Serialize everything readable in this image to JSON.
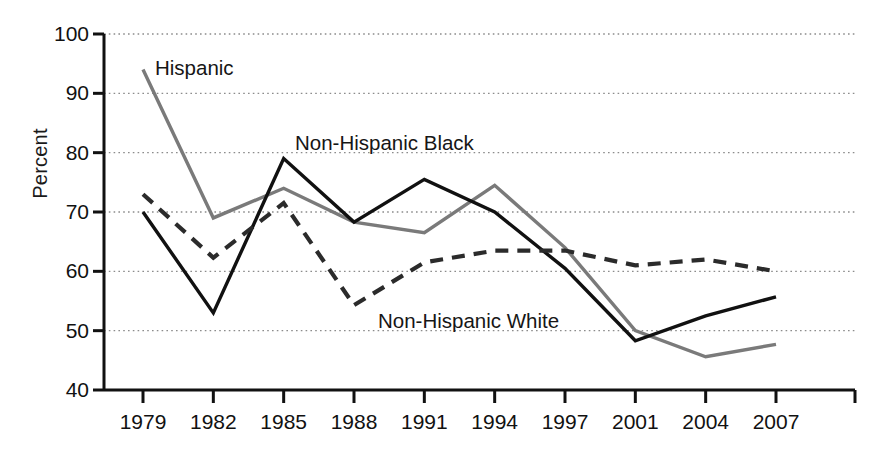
{
  "chart_data": {
    "type": "line",
    "title": "",
    "subtitle": "",
    "xlabel": "",
    "ylabel": "Percent",
    "categories": [
      "1979",
      "1982",
      "1985",
      "1988",
      "1991",
      "1994",
      "1997",
      "2001",
      "2004",
      "2007"
    ],
    "x_tick_labels": [
      "1979",
      "1982",
      "1985",
      "1988",
      "1991",
      "1994",
      "1997",
      "2001",
      "2004",
      "2007"
    ],
    "y_tick_labels": [
      "100",
      "90",
      "80",
      "70",
      "60",
      "50",
      "40"
    ],
    "y_ticks": [
      100,
      90,
      80,
      70,
      60,
      50,
      40
    ],
    "ylim": [
      40,
      100
    ],
    "grid": true,
    "grid_style": "dotted-horizontal",
    "legend_position": "inline-annotations",
    "series": [
      {
        "name": "Hispanic",
        "style": "solid",
        "color": "#7a7a7a",
        "values": [
          94,
          69,
          74,
          68.3,
          66.5,
          74.5,
          64,
          50,
          45.6,
          47.7
        ]
      },
      {
        "name": "Non-Hispanic Black",
        "style": "solid",
        "color": "#111111",
        "values": [
          70,
          53,
          79,
          68.3,
          75.5,
          70,
          60.5,
          48.3,
          52.5,
          55.7
        ]
      },
      {
        "name": "Non-Hispanic White",
        "style": "dashed",
        "color": "#2b2b2b",
        "values": [
          73,
          62.3,
          71.5,
          54.3,
          61.5,
          63.5,
          63.5,
          61,
          62,
          60
        ]
      }
    ],
    "annotations": [
      {
        "text": "Hispanic",
        "series": "Hispanic"
      },
      {
        "text": "Non-Hispanic Black",
        "series": "Non-Hispanic Black"
      },
      {
        "text": "Non-Hispanic White",
        "series": "Non-Hispanic White"
      }
    ]
  },
  "axis": {
    "y_label": "Percent",
    "y_ticks": [
      {
        "label": "100"
      },
      {
        "label": "90"
      },
      {
        "label": "80"
      },
      {
        "label": "70"
      },
      {
        "label": "60"
      },
      {
        "label": "50"
      },
      {
        "label": "40"
      }
    ],
    "x_ticks": [
      {
        "label": "1979"
      },
      {
        "label": "1982"
      },
      {
        "label": "1985"
      },
      {
        "label": "1988"
      },
      {
        "label": "1991"
      },
      {
        "label": "1994"
      },
      {
        "label": "1997"
      },
      {
        "label": "2001"
      },
      {
        "label": "2004"
      },
      {
        "label": "2007"
      }
    ]
  },
  "annotations": {
    "hispanic": "Hispanic",
    "non_hispanic_black": "Non-Hispanic Black",
    "non_hispanic_white": "Non-Hispanic White"
  },
  "colors": {
    "hispanic_line": "#7a7a7a",
    "black_line": "#111111",
    "white_line": "#2b2b2b",
    "axis": "#111111",
    "grid": "#8c8c8c",
    "background": "#ffffff"
  }
}
